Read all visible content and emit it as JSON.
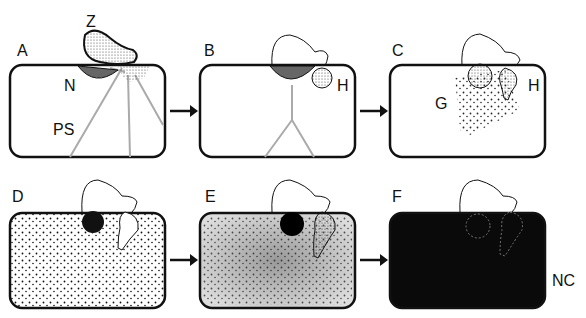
{
  "figure": {
    "panels": [
      {
        "id": "A",
        "label": "A",
        "annotations": [
          "Z",
          "N",
          "PS"
        ]
      },
      {
        "id": "B",
        "label": "B",
        "annotations": [
          "H"
        ]
      },
      {
        "id": "C",
        "label": "C",
        "annotations": [
          "G",
          "H"
        ]
      },
      {
        "id": "D",
        "label": "D",
        "annotations": []
      },
      {
        "id": "E",
        "label": "E",
        "annotations": []
      },
      {
        "id": "F",
        "label": "F",
        "annotations": [
          "NC"
        ]
      }
    ],
    "labels": {
      "A": "A",
      "B": "B",
      "C": "C",
      "D": "D",
      "E": "E",
      "F": "F",
      "Z": "Z",
      "N": "N",
      "PS": "PS",
      "H": "H",
      "G": "G",
      "NC": "NC"
    },
    "colors": {
      "ink": "#111111",
      "stipple": "#555555",
      "fill_dark": "#0a0a0a"
    }
  }
}
